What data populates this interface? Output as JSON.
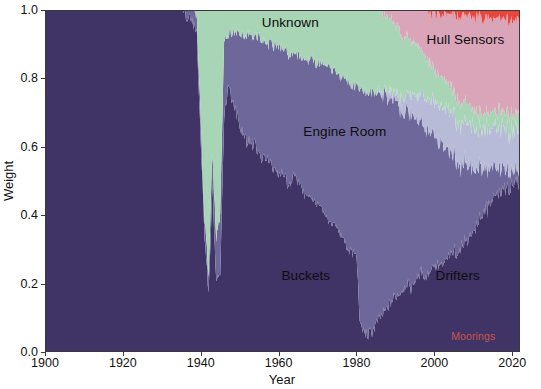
{
  "figure": {
    "width": 541,
    "height": 389,
    "background": "#ffffff"
  },
  "axes": {
    "x_title": "Year",
    "y_title": "Weight",
    "x_ticks": [
      "1900",
      "1920",
      "1940",
      "1960",
      "1980",
      "2000",
      "2020"
    ],
    "y_ticks": [
      "0.0",
      "0.2",
      "0.4",
      "0.6",
      "0.8",
      "1.0"
    ]
  },
  "labels": {
    "unknown": "Unknown",
    "hull_sensors": "Hull Sensors",
    "engine_room": "Engine Room",
    "buckets": "Buckets",
    "drifters": "Drifters",
    "moorings": "Moorings"
  },
  "colors": {
    "buckets": "#403366",
    "engine_room": "#6e6799",
    "hull_sensors": "#b8bbd8",
    "unknown": "#a8d5b5",
    "drifters": "#dba5b9",
    "moorings": "#e8453c",
    "grid": "#e6e6e6",
    "axis": "#3a3a3a",
    "text": "#111111"
  },
  "chart_data": {
    "type": "area",
    "stacked": true,
    "normalized": true,
    "title": "",
    "xlabel": "Year",
    "ylabel": "Weight",
    "xlim": [
      1900,
      2022
    ],
    "ylim": [
      0.0,
      1.0
    ],
    "grid": true,
    "legend": "in-plot annotations",
    "x": [
      1900,
      1901,
      1902,
      1903,
      1904,
      1905,
      1906,
      1907,
      1908,
      1909,
      1910,
      1911,
      1912,
      1913,
      1914,
      1915,
      1916,
      1917,
      1918,
      1919,
      1920,
      1921,
      1922,
      1923,
      1924,
      1925,
      1926,
      1927,
      1928,
      1929,
      1930,
      1931,
      1932,
      1933,
      1934,
      1935,
      1936,
      1937,
      1938,
      1939,
      1940,
      1941,
      1942,
      1943,
      1944,
      1945,
      1946,
      1947,
      1948,
      1949,
      1950,
      1951,
      1952,
      1953,
      1954,
      1955,
      1956,
      1957,
      1958,
      1959,
      1960,
      1961,
      1962,
      1963,
      1964,
      1965,
      1966,
      1967,
      1968,
      1969,
      1970,
      1971,
      1972,
      1973,
      1974,
      1975,
      1976,
      1977,
      1978,
      1979,
      1980,
      1981,
      1982,
      1983,
      1984,
      1985,
      1986,
      1987,
      1988,
      1989,
      1990,
      1991,
      1992,
      1993,
      1994,
      1995,
      1996,
      1997,
      1998,
      1999,
      2000,
      2001,
      2002,
      2003,
      2004,
      2005,
      2006,
      2007,
      2008,
      2009,
      2010,
      2011,
      2012,
      2013,
      2014,
      2015,
      2016,
      2017,
      2018,
      2019,
      2020,
      2021,
      2022
    ],
    "series": [
      {
        "name": "Buckets",
        "color": "#403366",
        "values": [
          1.0,
          1.0,
          1.0,
          1.0,
          1.0,
          1.0,
          1.0,
          1.0,
          1.0,
          1.0,
          1.0,
          1.0,
          1.0,
          1.0,
          1.0,
          1.0,
          1.0,
          1.0,
          1.0,
          1.0,
          1.0,
          1.0,
          1.0,
          1.0,
          1.0,
          1.0,
          1.0,
          1.0,
          1.0,
          1.0,
          1.0,
          1.0,
          1.0,
          1.0,
          1.0,
          1.0,
          0.99,
          0.98,
          0.96,
          0.93,
          0.62,
          0.33,
          0.18,
          0.48,
          0.2,
          0.22,
          0.7,
          0.78,
          0.74,
          0.7,
          0.66,
          0.64,
          0.61,
          0.6,
          0.62,
          0.58,
          0.57,
          0.56,
          0.55,
          0.54,
          0.52,
          0.53,
          0.5,
          0.49,
          0.52,
          0.5,
          0.47,
          0.46,
          0.45,
          0.44,
          0.43,
          0.42,
          0.4,
          0.38,
          0.37,
          0.36,
          0.34,
          0.32,
          0.3,
          0.29,
          0.28,
          0.07,
          0.06,
          0.05,
          0.06,
          0.08,
          0.1,
          0.11,
          0.13,
          0.15,
          0.16,
          0.17,
          0.19,
          0.2,
          0.18,
          0.21,
          0.22,
          0.23,
          0.22,
          0.24,
          0.25,
          0.26,
          0.25,
          0.27,
          0.28,
          0.29,
          0.3,
          0.31,
          0.33,
          0.34,
          0.36,
          0.38,
          0.4,
          0.42,
          0.44,
          0.45,
          0.47,
          0.48,
          0.49,
          0.5,
          0.5,
          0.51,
          0.52
        ]
      },
      {
        "name": "Engine Room",
        "color": "#6e6799",
        "values": [
          0.0,
          0.0,
          0.0,
          0.0,
          0.0,
          0.0,
          0.0,
          0.0,
          0.0,
          0.0,
          0.0,
          0.0,
          0.0,
          0.0,
          0.0,
          0.0,
          0.0,
          0.0,
          0.0,
          0.0,
          0.0,
          0.0,
          0.0,
          0.0,
          0.0,
          0.0,
          0.0,
          0.0,
          0.0,
          0.0,
          0.0,
          0.0,
          0.0,
          0.0,
          0.0,
          0.0,
          0.01,
          0.02,
          0.04,
          0.06,
          0.05,
          0.05,
          0.06,
          0.1,
          0.12,
          0.18,
          0.22,
          0.15,
          0.19,
          0.23,
          0.27,
          0.29,
          0.32,
          0.32,
          0.3,
          0.34,
          0.34,
          0.34,
          0.35,
          0.36,
          0.37,
          0.36,
          0.38,
          0.38,
          0.35,
          0.37,
          0.39,
          0.39,
          0.4,
          0.41,
          0.41,
          0.42,
          0.43,
          0.45,
          0.45,
          0.46,
          0.47,
          0.48,
          0.49,
          0.49,
          0.5,
          0.7,
          0.71,
          0.71,
          0.7,
          0.68,
          0.66,
          0.64,
          0.62,
          0.59,
          0.57,
          0.55,
          0.52,
          0.5,
          0.51,
          0.47,
          0.45,
          0.43,
          0.43,
          0.4,
          0.38,
          0.36,
          0.36,
          0.33,
          0.31,
          0.29,
          0.27,
          0.25,
          0.23,
          0.21,
          0.19,
          0.17,
          0.15,
          0.13,
          0.11,
          0.1,
          0.08,
          0.07,
          0.06,
          0.05,
          0.05,
          0.04,
          0.04
        ]
      },
      {
        "name": "Hull Sensors",
        "color": "#b8bbd8",
        "values": [
          0.0,
          0.0,
          0.0,
          0.0,
          0.0,
          0.0,
          0.0,
          0.0,
          0.0,
          0.0,
          0.0,
          0.0,
          0.0,
          0.0,
          0.0,
          0.0,
          0.0,
          0.0,
          0.0,
          0.0,
          0.0,
          0.0,
          0.0,
          0.0,
          0.0,
          0.0,
          0.0,
          0.0,
          0.0,
          0.0,
          0.0,
          0.0,
          0.0,
          0.0,
          0.0,
          0.0,
          0.0,
          0.0,
          0.0,
          0.0,
          0.0,
          0.0,
          0.0,
          0.0,
          0.0,
          0.0,
          0.0,
          0.0,
          0.0,
          0.0,
          0.0,
          0.0,
          0.0,
          0.0,
          0.0,
          0.0,
          0.0,
          0.0,
          0.0,
          0.0,
          0.0,
          0.0,
          0.0,
          0.0,
          0.0,
          0.0,
          0.0,
          0.0,
          0.0,
          0.0,
          0.0,
          0.0,
          0.0,
          0.0,
          0.0,
          0.0,
          0.0,
          0.0,
          0.0,
          0.0,
          0.0,
          0.0,
          0.0,
          0.0,
          0.0,
          0.0,
          0.01,
          0.01,
          0.01,
          0.02,
          0.02,
          0.03,
          0.04,
          0.05,
          0.06,
          0.07,
          0.08,
          0.09,
          0.09,
          0.1,
          0.1,
          0.11,
          0.11,
          0.12,
          0.12,
          0.12,
          0.12,
          0.12,
          0.12,
          0.12,
          0.12,
          0.12,
          0.12,
          0.12,
          0.12,
          0.12,
          0.12,
          0.12,
          0.12,
          0.12,
          0.12,
          0.12,
          0.12
        ]
      },
      {
        "name": "Unknown",
        "color": "#a8d5b5",
        "values": [
          0.0,
          0.0,
          0.0,
          0.0,
          0.0,
          0.0,
          0.0,
          0.0,
          0.0,
          0.0,
          0.0,
          0.0,
          0.0,
          0.0,
          0.0,
          0.0,
          0.0,
          0.0,
          0.0,
          0.0,
          0.0,
          0.0,
          0.0,
          0.0,
          0.0,
          0.0,
          0.0,
          0.0,
          0.0,
          0.0,
          0.0,
          0.0,
          0.0,
          0.0,
          0.0,
          0.0,
          0.0,
          0.0,
          0.0,
          0.01,
          0.33,
          0.62,
          0.76,
          0.42,
          0.68,
          0.6,
          0.08,
          0.07,
          0.07,
          0.07,
          0.07,
          0.07,
          0.07,
          0.08,
          0.08,
          0.08,
          0.09,
          0.1,
          0.1,
          0.1,
          0.11,
          0.11,
          0.12,
          0.13,
          0.13,
          0.13,
          0.14,
          0.15,
          0.15,
          0.15,
          0.16,
          0.16,
          0.17,
          0.17,
          0.18,
          0.18,
          0.19,
          0.2,
          0.21,
          0.22,
          0.22,
          0.23,
          0.23,
          0.24,
          0.24,
          0.24,
          0.23,
          0.23,
          0.22,
          0.21,
          0.2,
          0.19,
          0.18,
          0.17,
          0.16,
          0.15,
          0.14,
          0.13,
          0.12,
          0.11,
          0.1,
          0.09,
          0.09,
          0.08,
          0.08,
          0.07,
          0.07,
          0.06,
          0.06,
          0.06,
          0.05,
          0.05,
          0.05,
          0.05,
          0.05,
          0.05,
          0.05,
          0.05,
          0.05,
          0.05,
          0.05,
          0.05,
          0.05
        ]
      },
      {
        "name": "Drifters",
        "color": "#dba5b9",
        "values": [
          0.0,
          0.0,
          0.0,
          0.0,
          0.0,
          0.0,
          0.0,
          0.0,
          0.0,
          0.0,
          0.0,
          0.0,
          0.0,
          0.0,
          0.0,
          0.0,
          0.0,
          0.0,
          0.0,
          0.0,
          0.0,
          0.0,
          0.0,
          0.0,
          0.0,
          0.0,
          0.0,
          0.0,
          0.0,
          0.0,
          0.0,
          0.0,
          0.0,
          0.0,
          0.0,
          0.0,
          0.0,
          0.0,
          0.0,
          0.0,
          0.0,
          0.0,
          0.0,
          0.0,
          0.0,
          0.0,
          0.0,
          0.0,
          0.0,
          0.0,
          0.0,
          0.0,
          0.0,
          0.0,
          0.0,
          0.0,
          0.0,
          0.0,
          0.0,
          0.0,
          0.0,
          0.0,
          0.0,
          0.0,
          0.0,
          0.0,
          0.0,
          0.0,
          0.0,
          0.0,
          0.0,
          0.0,
          0.0,
          0.0,
          0.0,
          0.0,
          0.0,
          0.0,
          0.0,
          0.0,
          0.0,
          0.0,
          0.0,
          0.0,
          0.0,
          0.0,
          0.0,
          0.01,
          0.02,
          0.03,
          0.05,
          0.06,
          0.07,
          0.08,
          0.09,
          0.1,
          0.11,
          0.12,
          0.14,
          0.15,
          0.17,
          0.18,
          0.19,
          0.2,
          0.21,
          0.23,
          0.24,
          0.26,
          0.26,
          0.27,
          0.28,
          0.28,
          0.28,
          0.28,
          0.28,
          0.28,
          0.28,
          0.28,
          0.28,
          0.28,
          0.28,
          0.28,
          0.27
        ]
      },
      {
        "name": "Moorings",
        "color": "#e8453c",
        "values": [
          0.0,
          0.0,
          0.0,
          0.0,
          0.0,
          0.0,
          0.0,
          0.0,
          0.0,
          0.0,
          0.0,
          0.0,
          0.0,
          0.0,
          0.0,
          0.0,
          0.0,
          0.0,
          0.0,
          0.0,
          0.0,
          0.0,
          0.0,
          0.0,
          0.0,
          0.0,
          0.0,
          0.0,
          0.0,
          0.0,
          0.0,
          0.0,
          0.0,
          0.0,
          0.0,
          0.0,
          0.0,
          0.0,
          0.0,
          0.0,
          0.0,
          0.0,
          0.0,
          0.0,
          0.0,
          0.0,
          0.0,
          0.0,
          0.0,
          0.0,
          0.0,
          0.0,
          0.0,
          0.0,
          0.0,
          0.0,
          0.0,
          0.0,
          0.0,
          0.0,
          0.0,
          0.0,
          0.0,
          0.0,
          0.0,
          0.0,
          0.0,
          0.0,
          0.0,
          0.0,
          0.0,
          0.0,
          0.0,
          0.0,
          0.0,
          0.0,
          0.0,
          0.0,
          0.0,
          0.0,
          0.0,
          0.0,
          0.0,
          0.0,
          0.0,
          0.0,
          0.0,
          0.0,
          0.0,
          0.0,
          0.0,
          0.0,
          0.0,
          0.0,
          0.0,
          0.0,
          0.0,
          0.0,
          0.0,
          0.01,
          0.01,
          0.01,
          0.01,
          0.01,
          0.01,
          0.02,
          0.02,
          0.02,
          0.02,
          0.02,
          0.02,
          0.02,
          0.02,
          0.03,
          0.03,
          0.03,
          0.03,
          0.03,
          0.03,
          0.03,
          0.03,
          0.03,
          0.03
        ]
      }
    ],
    "annotations": [
      {
        "text": "Unknown",
        "x": 1963,
        "y": 0.965
      },
      {
        "text": "Hull Sensors",
        "x": 2008,
        "y": 0.915
      },
      {
        "text": "Engine Room",
        "x": 1977,
        "y": 0.645
      },
      {
        "text": "Buckets",
        "x": 1967,
        "y": 0.225
      },
      {
        "text": "Drifters",
        "x": 2006,
        "y": 0.225
      },
      {
        "text": "Moorings",
        "x": 2010,
        "y": 0.047
      }
    ]
  }
}
